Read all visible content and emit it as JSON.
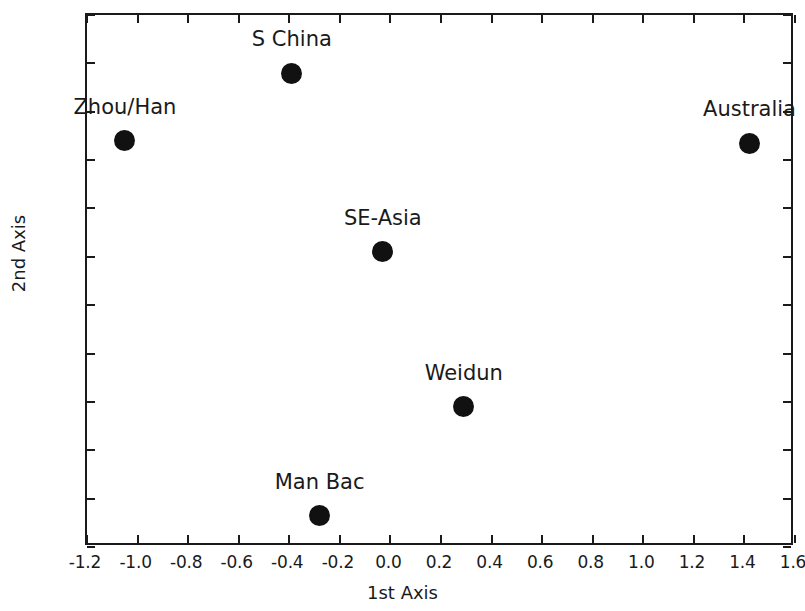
{
  "chart_data": {
    "type": "scatter",
    "title": "",
    "xlabel": "1st Axis",
    "ylabel": "2nd Axis",
    "xlim": [
      -1.2,
      1.6
    ],
    "ylim": [
      -1.2,
      1.0
    ],
    "grid": false,
    "legend": "none",
    "xticks": [
      "-1.2",
      "-1.0",
      "-0.8",
      "-0.6",
      "-0.4",
      "-0.2",
      "0.0",
      "0.2",
      "0.4",
      "0.6",
      "0.8",
      "1.0",
      "1.2",
      "1.4",
      "1.6"
    ],
    "xtick_values": [
      -1.2,
      -1.0,
      -0.8,
      -0.6,
      -0.4,
      -0.2,
      0.0,
      0.2,
      0.4,
      0.6,
      0.8,
      1.0,
      1.2,
      1.4,
      1.6
    ],
    "yticks": [
      "1.0",
      "0.8",
      "0.6",
      "0.4",
      "0.2",
      "0.0",
      "-0.2",
      "-0.4",
      "-0.6",
      "-0.8",
      "-1.0",
      "-1.2"
    ],
    "ytick_values": [
      1.0,
      0.8,
      0.6,
      0.4,
      0.2,
      0.0,
      -0.2,
      -0.4,
      -0.6,
      -0.8,
      -1.0,
      -1.2
    ],
    "marker": "filled-circle",
    "marker_color": "#111111",
    "points": [
      {
        "label": "Zhou/Han",
        "x": -1.05,
        "y": 0.48
      },
      {
        "label": "S China",
        "x": -0.39,
        "y": 0.76
      },
      {
        "label": "Australia",
        "x": 1.42,
        "y": 0.47
      },
      {
        "label": "SE-Asia",
        "x": -0.03,
        "y": 0.02
      },
      {
        "label": "Weidun",
        "x": 0.29,
        "y": -0.62
      },
      {
        "label": "Man Bac",
        "x": -0.28,
        "y": -1.07
      }
    ]
  }
}
